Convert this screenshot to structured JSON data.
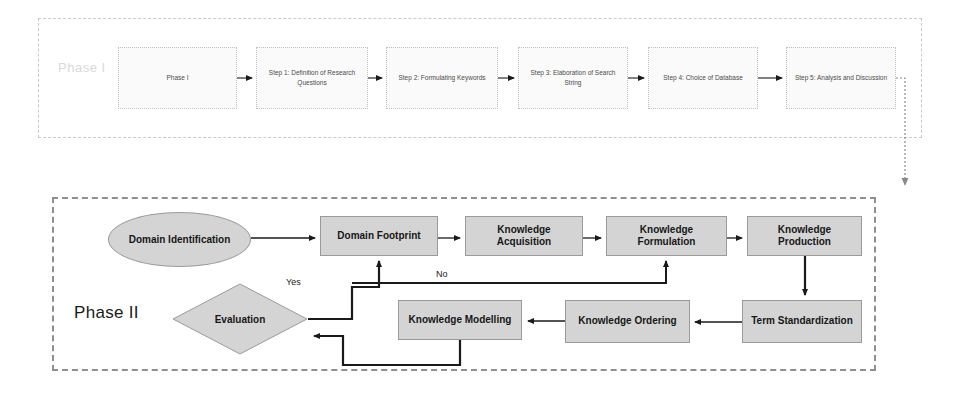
{
  "diagram": {
    "phases": [
      {
        "id": "phase1",
        "watermark_label": "Phase I",
        "steps": [
          {
            "label": "Phase I"
          },
          {
            "label": "Step 1: Definition of Research Questions"
          },
          {
            "label": "Step 2: Formulating Keywords"
          },
          {
            "label": "Step 3: Elaboration of Search String"
          },
          {
            "label": "Step 4: Choice of Database"
          },
          {
            "label": "Step 5: Analysis and Discussion"
          }
        ]
      },
      {
        "id": "phase2",
        "label": "Phase II",
        "start_node": {
          "label": "Domain Identification",
          "shape": "ellipse"
        },
        "decision_node": {
          "label": "Evaluation",
          "shape": "diamond"
        },
        "process_nodes": [
          {
            "label": "Domain Footprint"
          },
          {
            "label": "Knowledge Acquisition"
          },
          {
            "label": "Knowledge Formulation"
          },
          {
            "label": "Knowledge Production"
          },
          {
            "label": "Term Standardization"
          },
          {
            "label": "Knowledge Ordering"
          },
          {
            "label": "Knowledge Modelling"
          }
        ],
        "edge_labels": {
          "yes": "Yes",
          "no": "No"
        }
      }
    ],
    "colors": {
      "process_fill": "#d4d4d4",
      "process_stroke": "#9a9a9a",
      "phase1_fill": "#fafafa",
      "phase1_stroke": "#c0c0c0",
      "container_stroke": "#8f8f8f",
      "arrow": "#1a1a1a",
      "watermark": "#d9d9d9"
    }
  }
}
